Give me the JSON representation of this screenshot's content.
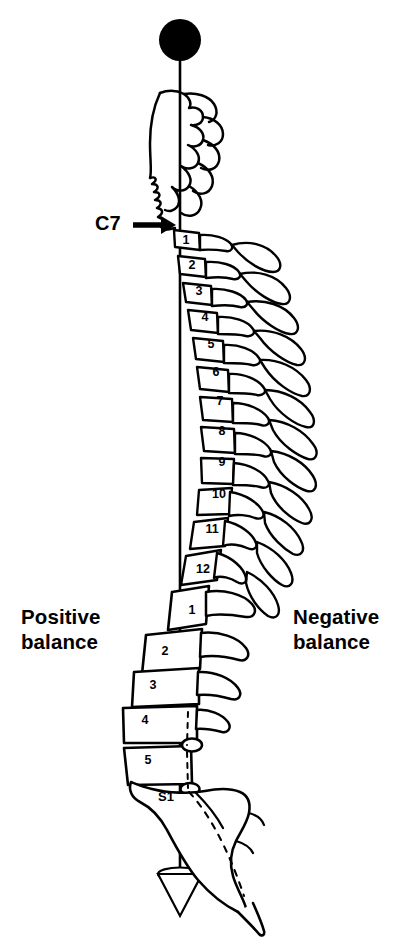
{
  "figure": {
    "labels": {
      "c7": "C7",
      "positive_balance": "Positive\nbalance",
      "negative_balance": "Negative\nbalance"
    },
    "plumb_line": {
      "top_marker": "filled-circle",
      "bottom_marker": "plumb-bob",
      "x": 180,
      "top_y": 40,
      "bottom_y": 872,
      "color": "#000000"
    },
    "colors": {
      "ink": "#000000",
      "background": "#ffffff"
    },
    "vertebrae": [
      {
        "label": "1",
        "region": "thoracic",
        "x": 186,
        "y": 240
      },
      {
        "label": "2",
        "region": "thoracic",
        "x": 192,
        "y": 265
      },
      {
        "label": "3",
        "region": "thoracic",
        "x": 199,
        "y": 291
      },
      {
        "label": "4",
        "region": "thoracic",
        "x": 205,
        "y": 317
      },
      {
        "label": "5",
        "region": "thoracic",
        "x": 211,
        "y": 344
      },
      {
        "label": "6",
        "region": "thoracic",
        "x": 216,
        "y": 372
      },
      {
        "label": "7",
        "region": "thoracic",
        "x": 220,
        "y": 401
      },
      {
        "label": "8",
        "region": "thoracic",
        "x": 222,
        "y": 431
      },
      {
        "label": "9",
        "region": "thoracic",
        "x": 222,
        "y": 462
      },
      {
        "label": "10",
        "region": "thoracic",
        "x": 219,
        "y": 494
      },
      {
        "label": "11",
        "region": "thoracic",
        "x": 212,
        "y": 529
      },
      {
        "label": "12",
        "region": "thoracic",
        "x": 203,
        "y": 569
      },
      {
        "label": "1",
        "region": "lumbar",
        "x": 192,
        "y": 610
      },
      {
        "label": "2",
        "region": "lumbar",
        "x": 165,
        "y": 651
      },
      {
        "label": "3",
        "region": "lumbar",
        "x": 153,
        "y": 685
      },
      {
        "label": "4",
        "region": "lumbar",
        "x": 145,
        "y": 720
      },
      {
        "label": "5",
        "region": "lumbar",
        "x": 148,
        "y": 760
      },
      {
        "label": "S1",
        "region": "sacral",
        "x": 166,
        "y": 796
      }
    ]
  }
}
